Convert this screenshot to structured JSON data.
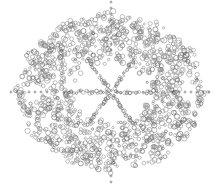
{
  "figure": {
    "width": 222,
    "height": 186,
    "background": "#ffffff",
    "stroke_color": "#8a8a8a",
    "stroke_dark": "#555555",
    "center": [
      111,
      92
    ],
    "outer_radii": [
      97,
      82
    ],
    "inner_hole_radii": [
      38,
      28
    ],
    "spokes": 6,
    "side_holes": [
      [
        34,
        93
      ],
      [
        188,
        93
      ]
    ],
    "axis_dots": "vertical and horizontal chains of small dots through center"
  }
}
